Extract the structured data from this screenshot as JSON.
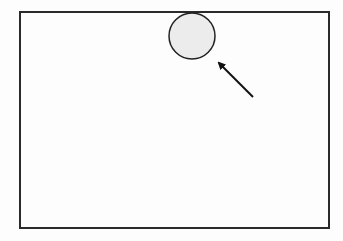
{
  "diagram": {
    "frame": {
      "x": 20,
      "y": 12,
      "width": 309,
      "height": 216,
      "stroke": "#2a2a2a",
      "stroke_width": 2
    },
    "circle": {
      "cx": 192,
      "cy": 36,
      "r": 23,
      "fill": "#ececec",
      "stroke": "#222222",
      "stroke_width": 1.5
    },
    "arrow": {
      "x1": 253,
      "y1": 97,
      "x2": 219,
      "y2": 63,
      "color": "#111111",
      "stroke_width": 2
    }
  }
}
